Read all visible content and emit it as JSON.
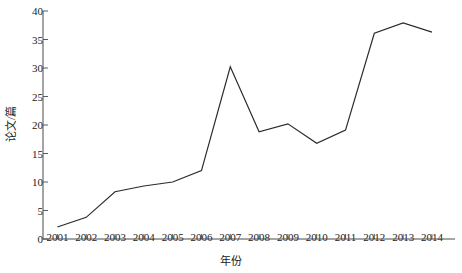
{
  "chart_data": {
    "type": "line",
    "title": "",
    "xlabel": "年份",
    "ylabel": "论文/篇",
    "categories": [
      "2001",
      "2002",
      "2003",
      "2004",
      "2005",
      "2006",
      "2007",
      "2008",
      "2009",
      "2010",
      "2011",
      "2012",
      "2013",
      "2014"
    ],
    "x": [
      2001,
      2002,
      2003,
      2004,
      2005,
      2006,
      2007,
      2008,
      2009,
      2010,
      2011,
      2012,
      2013,
      2014
    ],
    "values": [
      2.1,
      3.8,
      8.3,
      9.3,
      10.0,
      12.0,
      30.2,
      18.8,
      20.2,
      16.8,
      19.1,
      36.1,
      37.9,
      36.3
    ],
    "series": [
      {
        "name": "论文/篇",
        "values": [
          2.1,
          3.8,
          8.3,
          9.3,
          10.0,
          12.0,
          30.2,
          18.8,
          20.2,
          16.8,
          19.1,
          36.1,
          37.9,
          36.3
        ],
        "color": "#2b2b2b"
      }
    ],
    "ylim": [
      0,
      40
    ],
    "xlim": [
      2000.5,
      2014.8
    ],
    "yticks": [
      0,
      5,
      10,
      15,
      20,
      25,
      30,
      35,
      40
    ],
    "ytick_labels": [
      "0",
      "5",
      "10",
      "15",
      "20",
      "25",
      "30",
      "35",
      "40"
    ],
    "xticks": [
      2001,
      2002,
      2003,
      2004,
      2005,
      2006,
      2007,
      2008,
      2009,
      2010,
      2011,
      2012,
      2013,
      2014
    ],
    "xtick_labels": [
      "2001",
      "2002",
      "2003",
      "2004",
      "2005",
      "2006",
      "2007",
      "2008",
      "2009",
      "2010",
      "2011",
      "2012",
      "2013",
      "2014"
    ],
    "grid": false,
    "legend": null,
    "legend_position": "none",
    "line_color": "#2b2b2b",
    "line_width": 1.2,
    "markers": false,
    "axis_color": "#4a4a4a",
    "background": "#ffffff"
  }
}
